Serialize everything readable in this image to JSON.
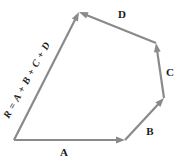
{
  "figure": {
    "type": "vector-addition-polygon",
    "background_color": "#ffffff",
    "stroke_color": "#8a8a8a",
    "text_color": "#1a1a1a",
    "stroke_width": 2.2
  },
  "labels": {
    "a": "A",
    "b": "B",
    "c": "C",
    "d": "D",
    "resultant_equation": "R = A + B + C + D"
  },
  "label_positions": {
    "a": {
      "x": 64,
      "y": 152
    },
    "b": {
      "x": 150,
      "y": 131
    },
    "c": {
      "x": 170,
      "y": 72
    },
    "d": {
      "x": 122,
      "y": 14
    },
    "resultant": {
      "x": 27,
      "y": 80,
      "rotation_deg": -61
    }
  },
  "vectors": [
    {
      "name": "A",
      "label": "A",
      "tail": {
        "x": 14,
        "y": 140
      },
      "head": {
        "x": 125,
        "y": 140
      },
      "description": "bottom edge pointing right"
    },
    {
      "name": "B",
      "label": "B",
      "tail": {
        "x": 125,
        "y": 140
      },
      "head": {
        "x": 164,
        "y": 98
      },
      "description": "lower-right edge pointing up-right"
    },
    {
      "name": "C",
      "label": "C",
      "tail": {
        "x": 164,
        "y": 98
      },
      "head": {
        "x": 156,
        "y": 43
      },
      "description": "right edge pointing up"
    },
    {
      "name": "D",
      "label": "D",
      "tail": {
        "x": 156,
        "y": 43
      },
      "head": {
        "x": 79,
        "y": 12
      },
      "description": "top edge pointing up-left to apex"
    },
    {
      "name": "R",
      "label": "R = A + B + C + D",
      "tail": {
        "x": 14,
        "y": 140
      },
      "head": {
        "x": 79,
        "y": 12
      },
      "description": "resultant diagonal from origin to apex"
    }
  ]
}
